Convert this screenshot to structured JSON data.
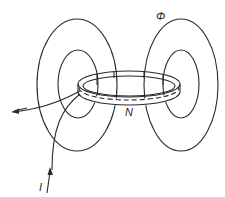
{
  "diagram": {
    "labels": {
      "flux": "Φ",
      "turns": "N",
      "current": "I"
    },
    "colors": {
      "stroke": "#2a2a2a",
      "background": "#ffffff"
    }
  }
}
